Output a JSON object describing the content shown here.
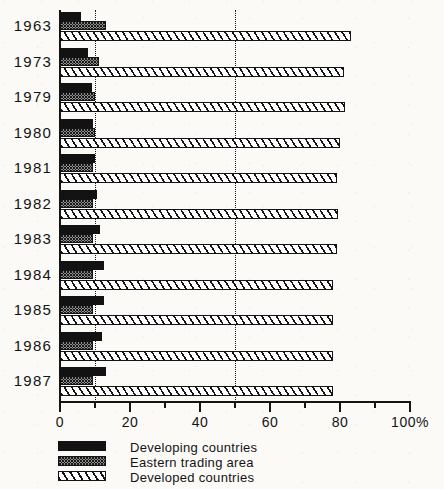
{
  "chart_data": {
    "type": "bar",
    "orientation": "horizontal",
    "title": "",
    "subtitle": "",
    "xlabel": "",
    "ylabel": "",
    "xlim": [
      0,
      100
    ],
    "ylim": null,
    "grid": true,
    "gridlines": [
      10,
      50
    ],
    "grid_style": "dotted-vertical",
    "legend_position": "bottom-left",
    "axis_unit": "%",
    "x_ticks_major": [
      0,
      20,
      40,
      60,
      80,
      100
    ],
    "x_ticks_minor": [
      10,
      30,
      50,
      70,
      90
    ],
    "x_tick_labels": [
      "0",
      "20",
      "40",
      "60",
      "80",
      "100%"
    ],
    "categories": [
      "1963",
      "1973",
      "1979",
      "1980",
      "1981",
      "1982",
      "1983",
      "1984",
      "1985",
      "1986",
      "1987"
    ],
    "series": [
      {
        "name": "Developing countries",
        "pattern": "solid-black",
        "values": [
          6,
          8,
          9,
          9.5,
          10,
          10.5,
          11.5,
          12.5,
          12.5,
          12,
          13
        ]
      },
      {
        "name": "Eastern trading area",
        "pattern": "stippled",
        "values": [
          13,
          11,
          10,
          10,
          9.5,
          9.5,
          9.5,
          9.5,
          9.5,
          9.5,
          9.5
        ]
      },
      {
        "name": "Developed countries",
        "pattern": "diagonal-hatch",
        "values": [
          83,
          81,
          81.5,
          80,
          79,
          79.5,
          79,
          78,
          78,
          78,
          78
        ]
      }
    ]
  },
  "legend": {
    "items": [
      {
        "label": "Developing countries",
        "swatch": "developing"
      },
      {
        "label": "Eastern trading area",
        "swatch": "eastern"
      },
      {
        "label": "Developed countries",
        "swatch": "developed"
      }
    ]
  }
}
